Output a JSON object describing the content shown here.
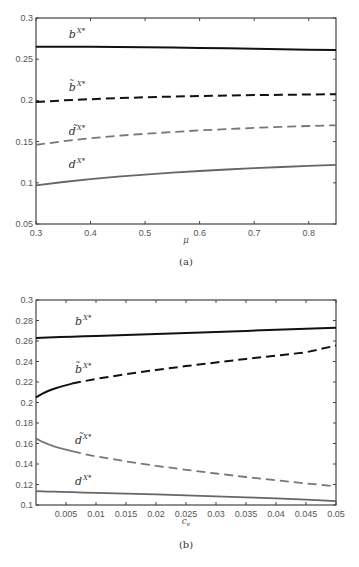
{
  "chart_data": [
    {
      "id": "a",
      "type": "line",
      "caption": "(a)",
      "title": "",
      "xlabel": "μ",
      "ylabel": "",
      "xlim": [
        0.3,
        0.85
      ],
      "ylim": [
        0.05,
        0.3
      ],
      "xticks": [
        0.3,
        0.4,
        0.5,
        0.6,
        0.7,
        0.8
      ],
      "xtick_labels": [
        "0.3",
        "0.4",
        "0.5",
        "0.6",
        "0.7",
        "0.8"
      ],
      "yticks": [
        0.05,
        0.1,
        0.15,
        0.2,
        0.25,
        0.3
      ],
      "ytick_labels": [
        "0.05",
        "0.1",
        "0.15",
        "0.2",
        "0.25",
        "0.3"
      ],
      "grid": false,
      "legend": "inline labels",
      "x": [
        0.3,
        0.35,
        0.4,
        0.45,
        0.5,
        0.55,
        0.6,
        0.65,
        0.7,
        0.75,
        0.8,
        0.85
      ],
      "series": [
        {
          "name": "b^{X*}",
          "label_base": "b",
          "label_sup": "X*",
          "style": "solid",
          "color": "#111111",
          "values": [
            0.265,
            0.265,
            0.265,
            0.2648,
            0.2645,
            0.2641,
            0.2637,
            0.2632,
            0.2626,
            0.2621,
            0.2615,
            0.261
          ],
          "label_pos": [
            0.36,
            0.276
          ]
        },
        {
          "name": "b̃^{X*}",
          "label_base": "b̃",
          "label_sup": "X*",
          "style": "dashed",
          "color": "#111111",
          "values": [
            0.198,
            0.2,
            0.2015,
            0.2028,
            0.2038,
            0.2046,
            0.2053,
            0.2059,
            0.2064,
            0.2068,
            0.2072,
            0.2075
          ],
          "label_pos": [
            0.36,
            0.212
          ]
        },
        {
          "name": "d̃^{X*}",
          "label_base": "d̃",
          "label_sup": "X*",
          "style": "dashed",
          "color": "#777777",
          "values": [
            0.146,
            0.1505,
            0.154,
            0.157,
            0.1595,
            0.1617,
            0.1636,
            0.1652,
            0.1666,
            0.1678,
            0.1689,
            0.1698
          ],
          "label_pos": [
            0.36,
            0.158
          ]
        },
        {
          "name": "d^{X*}",
          "label_base": "d",
          "label_sup": "X*",
          "style": "solid",
          "color": "#666666",
          "values": [
            0.097,
            0.101,
            0.1045,
            0.1075,
            0.11,
            0.1123,
            0.1143,
            0.1161,
            0.1177,
            0.1192,
            0.1205,
            0.1218
          ],
          "label_pos": [
            0.36,
            0.118
          ]
        }
      ]
    },
    {
      "id": "b",
      "type": "line",
      "caption": "(b)",
      "title": "",
      "xlabel": "c_e",
      "ylabel": "",
      "xlim": [
        0.0,
        0.05
      ],
      "ylim": [
        0.1,
        0.3
      ],
      "xticks": [
        0.005,
        0.01,
        0.015,
        0.02,
        0.025,
        0.03,
        0.035,
        0.04,
        0.045,
        0.05
      ],
      "xtick_labels": [
        "0.005",
        "0.01",
        "0.015",
        "0.02",
        "0.025",
        "0.03",
        "0.035",
        "0.04",
        "0.045",
        "0.05"
      ],
      "yticks": [
        0.1,
        0.12,
        0.14,
        0.16,
        0.18,
        0.2,
        0.22,
        0.24,
        0.26,
        0.28,
        0.3
      ],
      "ytick_labels": [
        "0.1",
        "0.12",
        "0.14",
        "0.16",
        "0.18",
        "0.2",
        "0.22",
        "0.24",
        "0.26",
        "0.28",
        "0.3"
      ],
      "grid": false,
      "legend": "inline labels",
      "x": [
        0.0,
        0.001,
        0.002,
        0.003,
        0.004,
        0.006,
        0.008,
        0.01,
        0.015,
        0.02,
        0.025,
        0.03,
        0.035,
        0.04,
        0.045,
        0.05
      ],
      "series": [
        {
          "name": "b^{X*}",
          "label_base": "b",
          "label_sup": "X*",
          "style": "solid",
          "color": "#111111",
          "values": [
            0.263,
            0.2632,
            0.2634,
            0.2636,
            0.2638,
            0.2642,
            0.2646,
            0.265,
            0.266,
            0.2669,
            0.2679,
            0.2689,
            0.2699,
            0.2709,
            0.2719,
            0.273
          ],
          "label_pos": [
            0.0065,
            0.276
          ]
        },
        {
          "name": "b̃^{X*}",
          "label_base": "b̃",
          "label_sup": "X*",
          "style": "dashed_after_threshold",
          "solid_until": 0.006,
          "color": "#111111",
          "values": [
            0.205,
            0.2085,
            0.2112,
            0.2134,
            0.2152,
            0.2184,
            0.2208,
            0.223,
            0.2276,
            0.2317,
            0.2355,
            0.239,
            0.2425,
            0.2458,
            0.249,
            0.2555
          ],
          "label_pos": [
            0.0065,
            0.229
          ]
        },
        {
          "name": "d̃^{X*}",
          "label_base": "d̃",
          "label_sup": "X*",
          "style": "dashed_after_threshold",
          "solid_until": 0.006,
          "color": "#777777",
          "values": [
            0.165,
            0.1618,
            0.1594,
            0.1573,
            0.1555,
            0.1525,
            0.1498,
            0.1475,
            0.1425,
            0.1382,
            0.1343,
            0.1307,
            0.1273,
            0.1241,
            0.1211,
            0.1182
          ],
          "label_pos": [
            0.0065,
            0.16
          ]
        },
        {
          "name": "d^{X*}",
          "label_base": "d",
          "label_sup": "X*",
          "style": "solid",
          "color": "#666666",
          "values": [
            0.1135,
            0.1133,
            0.1131,
            0.113,
            0.1128,
            0.1125,
            0.1121,
            0.1118,
            0.1111,
            0.1103,
            0.1094,
            0.1085,
            0.1075,
            0.1064,
            0.1052,
            0.1038
          ],
          "label_pos": [
            0.0065,
            0.12
          ]
        }
      ]
    }
  ],
  "layout": {
    "panels": [
      {
        "left": 36,
        "right": 336,
        "top": 18,
        "bottom": 224,
        "xlabel_y": 243,
        "caption_y": 265
      },
      {
        "left": 36,
        "right": 336,
        "top": 300,
        "bottom": 505,
        "xlabel_y": 524,
        "caption_y": 548
      }
    ]
  }
}
